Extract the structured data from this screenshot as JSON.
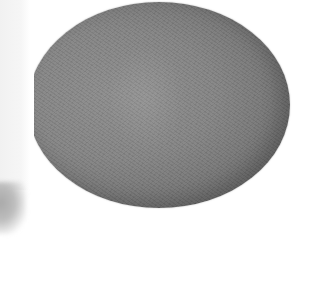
{
  "image": {
    "description": "Grey fabric-covered oval lid (toilet seat lid cover) on white background",
    "subject": "toilet-lid-cover",
    "colors": {
      "background": "#ffffff",
      "fabric_center": "#8a8a8a",
      "fabric_edge": "#6a6a6a",
      "left_strip": "#f4f4f4",
      "shadow_blob": "#b0b0b0"
    }
  }
}
